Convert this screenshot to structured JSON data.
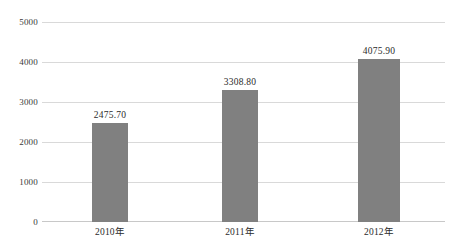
{
  "chart_data": {
    "type": "bar",
    "title": "",
    "subtitle": "",
    "xlabel": "",
    "ylabel": "",
    "categories": [
      "2010年",
      "2011年",
      "2012年"
    ],
    "values": [
      2475.7,
      4075.9,
      3308.8
    ],
    "value_labels": [
      "2475.70",
      "3308.80",
      "4075.90"
    ],
    "series": [
      {
        "name": "",
        "values": [
          2475.7,
          3308.8,
          4075.9
        ]
      }
    ],
    "ylim": [
      0,
      5000
    ],
    "ytick_values": [
      0,
      1000,
      2000,
      3000,
      4000,
      5000
    ],
    "ytick_labels": [
      "0",
      "1000",
      "2000",
      "3000",
      "4000",
      "5000"
    ],
    "grid": true,
    "grid_axis": "y",
    "legend": false,
    "legend_position": "none",
    "annotations": [],
    "colors": {
      "bar": "#808080",
      "gridline": "#d9d9d9",
      "axis": "#c8c8c8",
      "text": "#2b2b2b",
      "background": "#ffffff"
    }
  }
}
